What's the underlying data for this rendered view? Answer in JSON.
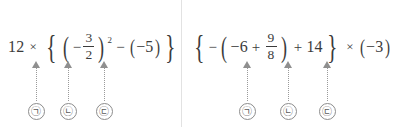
{
  "layout": {
    "divider_x": 181,
    "text_color": "#3b3b3b",
    "arrow_color": "#8f8f8f",
    "divider_color": "#e2e2e2",
    "background": "#ffffff"
  },
  "panels": [
    {
      "id": "left-problem",
      "expression_text": "12 × {(−3/2)² − (−5)}",
      "tokens": {
        "coefficient": "12",
        "times": "×",
        "brace_open": "{",
        "paren_open": "(",
        "inner_minus": "−",
        "frac_num": "3",
        "frac_den": "2",
        "paren_close": ")",
        "exponent": "2",
        "subtract": "−",
        "paren2_open": "(",
        "neg_five": "−5",
        "paren2_close": ")",
        "brace_close": "}"
      },
      "markers": [
        {
          "label": "㉠",
          "target": "times-operator",
          "x": 36
        },
        {
          "label": "㉡",
          "target": "fraction-bar",
          "x": 68
        },
        {
          "label": "㉢",
          "target": "subtraction-operator",
          "x": 104
        }
      ]
    },
    {
      "id": "right-problem",
      "expression_text": "{−(−6 + 9/8) + 14} × (−3)",
      "tokens": {
        "brace_open": "{",
        "lead_minus": "−",
        "paren_open": "(",
        "neg_six": "−6",
        "plus_inner": "+",
        "frac_num": "9",
        "frac_den": "8",
        "paren_close": ")",
        "plus_outer": "+",
        "fourteen": "14",
        "brace_close": "}",
        "times": "×",
        "paren2_open": "(",
        "neg_three": "−3",
        "paren2_close": ")"
      },
      "markers": [
        {
          "label": "㉠",
          "target": "inner-plus-operator",
          "x": 247
        },
        {
          "label": "㉡",
          "target": "outer-plus-operator",
          "x": 288
        },
        {
          "label": "㉢",
          "target": "times-operator",
          "x": 327
        }
      ]
    }
  ]
}
